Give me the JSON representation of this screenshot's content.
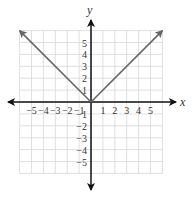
{
  "chart_data": {
    "type": "line",
    "title": "",
    "function": "y = |x|",
    "xlabel": "x",
    "ylabel": "y",
    "xlim": [
      -6,
      6
    ],
    "ylim": [
      -6,
      6
    ],
    "grid": true,
    "x_ticks": [
      -5,
      -4,
      -3,
      -2,
      -1,
      1,
      2,
      3,
      4,
      5
    ],
    "y_ticks": [
      -5,
      -4,
      -3,
      -2,
      -1,
      1,
      2,
      3,
      4,
      5
    ],
    "x_tick_labels": [
      "−5",
      "−4",
      "−3",
      "−2",
      "−1",
      "1",
      "2",
      "3",
      "4",
      "5"
    ],
    "y_tick_labels": [
      "5",
      "4",
      "3",
      "2",
      "1",
      "−1",
      "−2",
      "−3",
      "−4",
      "−5"
    ],
    "series": [
      {
        "name": "y = |x|",
        "points": [
          [
            -6,
            6
          ],
          [
            0,
            0
          ],
          [
            6,
            6
          ]
        ],
        "arrows_at_ends": true,
        "color": "#666666"
      }
    ],
    "colors": {
      "axis": "#111111",
      "grid": "#d8d8d8",
      "line": "#666666"
    }
  }
}
